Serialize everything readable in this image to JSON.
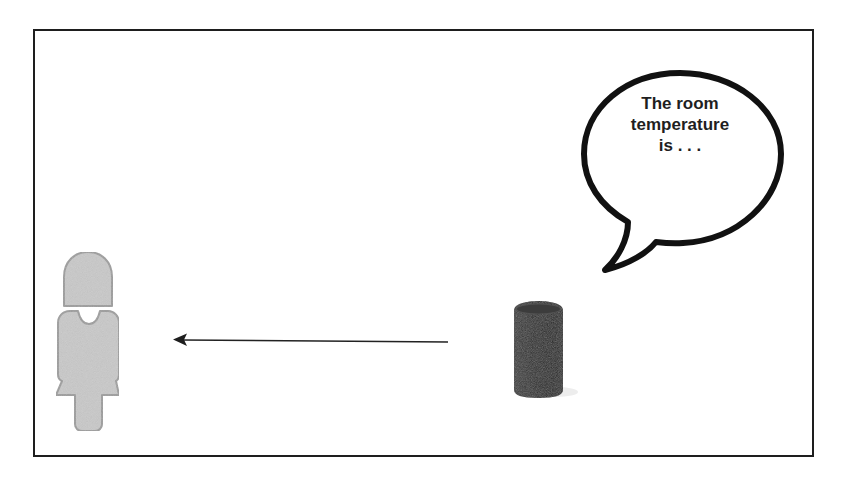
{
  "diagram": {
    "title": "",
    "speech_bubble": {
      "lines": [
        "The room",
        "temperature",
        "is . . ."
      ],
      "speaker": "smart-speaker"
    },
    "nodes": [
      {
        "id": "person",
        "label": "",
        "icon": "person-icon",
        "color": "#c8c8c8",
        "outline": "#9a9a9a"
      },
      {
        "id": "smart-speaker",
        "label": "",
        "icon": "smart-speaker-icon",
        "color": "#2e2e2e"
      }
    ],
    "edges": [
      {
        "from": "smart-speaker",
        "to": "person",
        "style": "solid-arrow",
        "label": ""
      }
    ],
    "colors": {
      "frame": "#1e1e1e",
      "bubble_stroke": "#111111",
      "arrow": "#222222",
      "text": "#1f1f1f"
    }
  }
}
